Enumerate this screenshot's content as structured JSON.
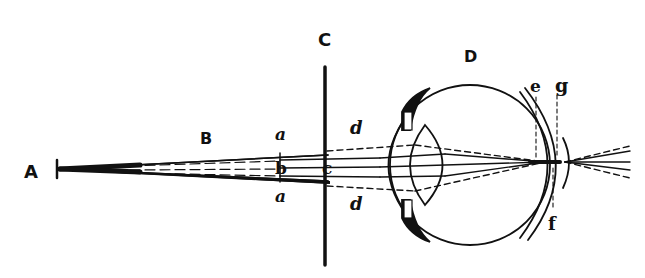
{
  "diagram": {
    "labels": {
      "A": "A",
      "B": "B",
      "C": "C",
      "D": "D",
      "a_top": "a",
      "a_bottom": "a",
      "b": "b",
      "c": "c",
      "d_top": "d",
      "d_bottom": "d",
      "e": "e",
      "f": "f",
      "g": "g"
    },
    "colors": {
      "ink": "#111111",
      "background": "#ffffff"
    }
  }
}
